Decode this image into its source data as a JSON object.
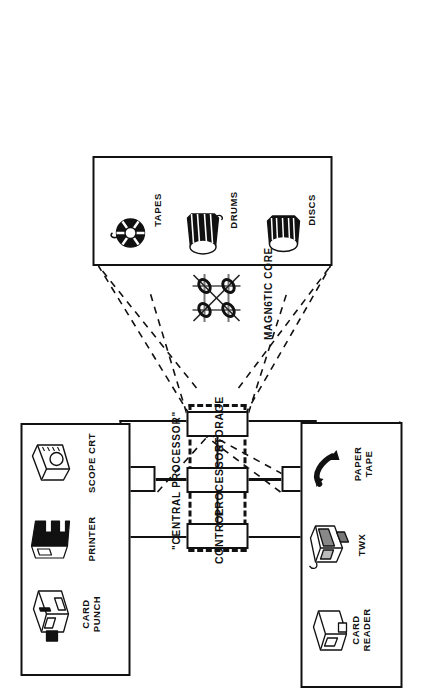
{
  "figure": {
    "central_processor_label": "\"CENTRAL PROCESSOR\"",
    "magnetic_core_label": "MAGN6TIC CORE",
    "stroke_color": "#111111",
    "background_color": "#ffffff"
  },
  "central_processor": {
    "units": [
      {
        "id": "control",
        "label": "CONTROL",
        "icon": "block-icon"
      },
      {
        "id": "processor",
        "label": "PROCESSOR",
        "icon": "block-icon"
      },
      {
        "id": "storage",
        "label": "STORAGE",
        "icon": "block-icon"
      }
    ]
  },
  "io_units": [
    {
      "id": "output",
      "label": "OUTPUT"
    },
    {
      "id": "input",
      "label": "INPUT"
    }
  ],
  "peripheral_groups": [
    {
      "id": "output-devices",
      "connects_to": "output",
      "devices": [
        {
          "id": "scope-crt",
          "label": "SCOPE CRT",
          "icon": "crt-monitor-icon"
        },
        {
          "id": "printer",
          "label": "PRINTER",
          "icon": "printer-icon"
        },
        {
          "id": "card-punch",
          "label": "CARD\nPUNCH",
          "icon": "card-punch-icon"
        }
      ]
    },
    {
      "id": "storage-devices",
      "connects_to": "storage",
      "devices": [
        {
          "id": "tapes",
          "label": "TAPES",
          "icon": "tape-reel-icon"
        },
        {
          "id": "drums",
          "label": "DRUMS",
          "icon": "drum-cylinder-icon"
        },
        {
          "id": "discs",
          "label": "DISCS",
          "icon": "disc-cylinder-icon"
        }
      ]
    },
    {
      "id": "input-devices",
      "connects_to": "input",
      "devices": [
        {
          "id": "paper-tape",
          "label": "PAPER\nTAPE",
          "icon": "paper-tape-icon"
        },
        {
          "id": "twx",
          "label": "TWX",
          "icon": "teletype-icon"
        },
        {
          "id": "card-reader",
          "label": "CARD\nREADER",
          "icon": "card-reader-icon"
        }
      ]
    }
  ],
  "core_memory": {
    "id": "magnetic-core",
    "label": "MAGN6TIC CORE",
    "icon": "core-matrix-icon"
  }
}
